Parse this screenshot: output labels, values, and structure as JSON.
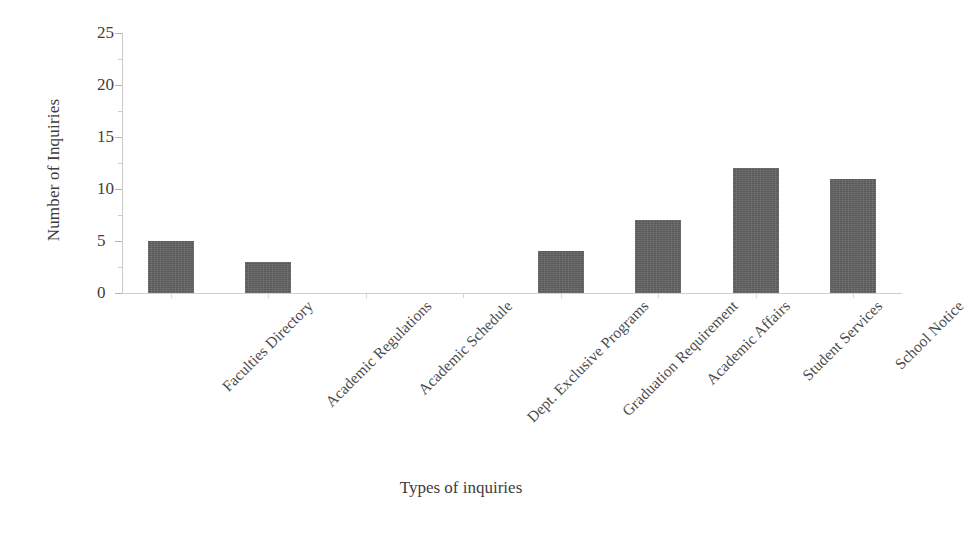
{
  "chart_data": {
    "type": "bar",
    "title": "",
    "xlabel": "Types of inquiries",
    "ylabel": "Number of Inquiries",
    "categories": [
      "Faculties Directory",
      "Academic Regulations",
      "Academic Schedule",
      "Dept. Exclusive Programs",
      "Graduation Requirement",
      "Academic Affairs",
      "Student Services",
      "School Notice"
    ],
    "values": [
      5,
      3,
      0,
      0,
      4,
      7,
      12,
      11
    ],
    "ylim": [
      0,
      25
    ],
    "ytick_labels": [
      "0",
      "5",
      "10",
      "15",
      "20",
      "25"
    ],
    "ytick_values": [
      0,
      5,
      10,
      15,
      20,
      25
    ],
    "yminor_values": [
      2.5,
      7.5,
      12.5,
      17.5,
      22.5
    ],
    "grid": false,
    "legend": false,
    "bar_color": "#585858",
    "axis_color": "#c9c9c9",
    "text_color": "#3d3d3d",
    "xlabel_rotation": 45
  }
}
